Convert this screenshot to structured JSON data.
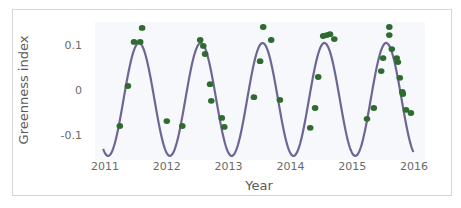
{
  "chart_data": {
    "type": "scatter",
    "title": "",
    "xlabel": "Year",
    "ylabel": "Greenness index",
    "xlim": [
      2011,
      2016
    ],
    "ylim": [
      -0.1,
      0.1
    ],
    "x_ticks": [
      "2011",
      "2012",
      "2013",
      "2014",
      "2015",
      "2016"
    ],
    "y_ticks": [
      "0.1",
      "0",
      "-0.1"
    ],
    "grid": false,
    "legend": null,
    "colors": {
      "points": "#2e6b2e",
      "curve": "#6e6496",
      "plot_bg": "#f6f8fb"
    },
    "series": [
      {
        "name": "observations",
        "kind": "scatter",
        "x": [
          2011.24,
          2011.37,
          2011.47,
          2011.57,
          2011.6,
          2012.0,
          2012.25,
          2012.54,
          2012.59,
          2012.62,
          2012.7,
          2012.72,
          2012.89,
          2012.93,
          2013.41,
          2013.51,
          2013.56,
          2013.69,
          2013.83,
          2014.32,
          2014.4,
          2014.45,
          2014.53,
          2014.59,
          2014.64,
          2014.71,
          2015.24,
          2015.35,
          2015.47,
          2015.5,
          2015.6,
          2015.6,
          2015.64,
          2015.72,
          2015.74,
          2015.77,
          2015.81,
          2015.82,
          2015.87,
          2015.95
        ],
        "y": [
          -0.08,
          0.009,
          0.107,
          0.107,
          0.138,
          -0.069,
          -0.08,
          0.111,
          0.098,
          0.08,
          0.013,
          -0.024,
          -0.062,
          -0.082,
          -0.016,
          0.064,
          0.14,
          0.111,
          -0.022,
          -0.084,
          -0.04,
          0.029,
          0.12,
          0.122,
          0.124,
          0.113,
          -0.064,
          -0.04,
          0.042,
          0.071,
          0.14,
          0.122,
          0.091,
          0.071,
          0.062,
          0.027,
          -0.004,
          -0.009,
          -0.044,
          -0.051
        ]
      },
      {
        "name": "seasonal fit",
        "kind": "line",
        "model": "y = mean - amplitude*cos(2*pi*(t - min_phase))",
        "mean": -0.021,
        "amplitude": 0.1255,
        "min_phase": 2011.05,
        "t_range": [
          2010.97,
          2015.99
        ]
      }
    ]
  }
}
